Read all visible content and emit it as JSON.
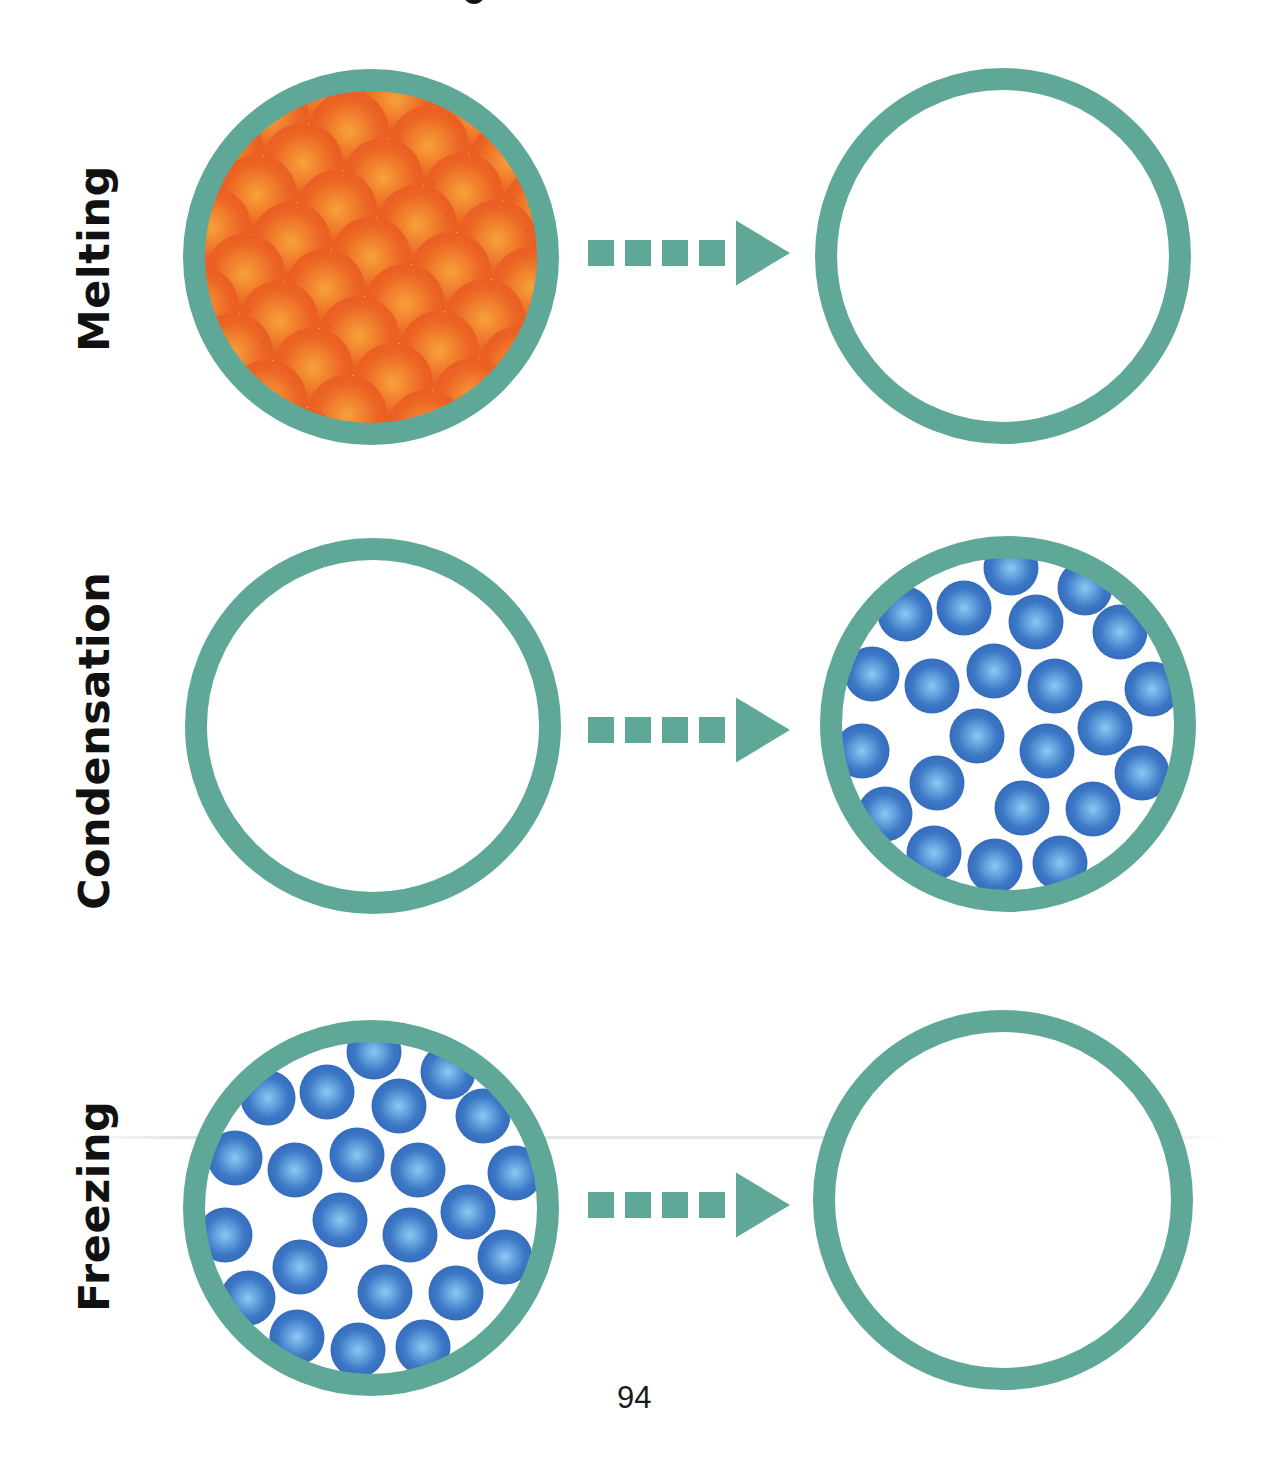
{
  "page": {
    "page_number": "94",
    "title_fragment_visible": true
  },
  "colors": {
    "ring": "#5fa898",
    "arrow": "#5fa898",
    "solid_particle_light": "#f7a23a",
    "solid_particle_dark": "#ec6424",
    "liquid_particle_light": "#8cc8f2",
    "liquid_particle_dark": "#3c78c6",
    "label_text": "#111111"
  },
  "rows": [
    {
      "label": "Melting",
      "label_box": {
        "x": 77,
        "y_bottom": 352
      },
      "arrow": {
        "y": 253
      },
      "left": {
        "cx": 371,
        "cy": 257,
        "r": 188,
        "content": "solid-particles"
      },
      "right": {
        "cx": 1003,
        "cy": 256,
        "r": 188,
        "content": "empty"
      }
    },
    {
      "label": "Condensation",
      "label_box": {
        "x": 77,
        "y_bottom": 910
      },
      "arrow": {
        "y": 730
      },
      "left": {
        "cx": 373,
        "cy": 726,
        "r": 188,
        "content": "empty"
      },
      "right": {
        "cx": 1008,
        "cy": 724,
        "r": 188,
        "content": "liquid-particles"
      }
    },
    {
      "label": "Freezing",
      "label_box": {
        "x": 77,
        "y_bottom": 1312
      },
      "arrow": {
        "y": 1205
      },
      "left": {
        "cx": 371,
        "cy": 1208,
        "r": 188,
        "content": "liquid-particles"
      },
      "right": {
        "cx": 1003,
        "cy": 1200,
        "r": 190,
        "content": "empty"
      }
    }
  ],
  "arrow_shape": {
    "x_start": 588,
    "square_size": 26,
    "square_gap": 11,
    "square_count": 4,
    "triangle_x_start": 736,
    "triangle_width": 54,
    "triangle_height": 65
  },
  "ring_width": 22,
  "solid_lattice": {
    "origin": {
      "dx": 0,
      "dy": 0
    },
    "a": [
      80,
      15
    ],
    "b": [
      -46,
      32
    ],
    "particle_r": 40
  },
  "liquid_particles": {
    "particle_r": 27.5,
    "offsets": [
      [
        3,
        -156
      ],
      [
        77,
        -136
      ],
      [
        -103,
        -110
      ],
      [
        -44,
        -116
      ],
      [
        28,
        -102
      ],
      [
        112,
        -92
      ],
      [
        -136,
        -50
      ],
      [
        -76,
        -38
      ],
      [
        -14,
        -53
      ],
      [
        47,
        -38
      ],
      [
        144,
        -35
      ],
      [
        -31,
        12
      ],
      [
        39,
        27
      ],
      [
        97,
        4
      ],
      [
        -146,
        27
      ],
      [
        134,
        49
      ],
      [
        -71,
        59
      ],
      [
        -123,
        90
      ],
      [
        14,
        84
      ],
      [
        85,
        85
      ],
      [
        -74,
        129
      ],
      [
        -13,
        142
      ],
      [
        52,
        139
      ]
    ]
  }
}
